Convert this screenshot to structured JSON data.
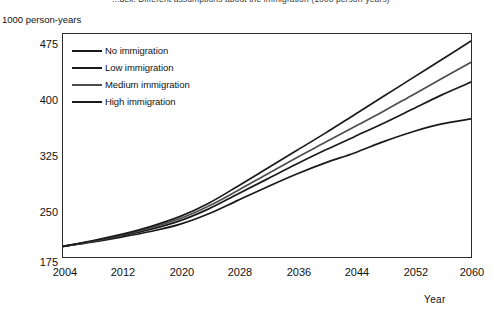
{
  "top_title": "...dex. Different assumptions about the immigration (1000 person-years)",
  "y_axis": {
    "unit_label": "1000 person-years",
    "ticks": [
      "475",
      "400",
      "325",
      "250",
      "175"
    ]
  },
  "x_axis": {
    "title": "Year",
    "ticks": [
      "2004",
      "2012",
      "2020",
      "2028",
      "2036",
      "2044",
      "2052",
      "2060"
    ]
  },
  "legend": {
    "items": [
      {
        "label": "No  immigration",
        "color": "#1a1a1a"
      },
      {
        "label": "Low  immigration",
        "color": "#1a1a1a"
      },
      {
        "label": "Medium immigration",
        "color": "#4d4d4d"
      },
      {
        "label": "High immigration",
        "color": "#1a1a1a"
      }
    ]
  },
  "chart_data": {
    "type": "line",
    "title": "Different assumptions about the immigration (1000 person-years)",
    "xlabel": "Year",
    "ylabel": "1000 person-years",
    "xlim": [
      2004,
      2060
    ],
    "ylim": [
      175,
      490
    ],
    "xticks": [
      2004,
      2012,
      2020,
      2028,
      2036,
      2044,
      2052,
      2060
    ],
    "yticks": [
      175,
      250,
      325,
      400,
      475
    ],
    "grid": false,
    "legend_position": "top-left-inside",
    "x": [
      2004,
      2008,
      2012,
      2016,
      2020,
      2024,
      2028,
      2032,
      2036,
      2040,
      2044,
      2048,
      2052,
      2056,
      2060
    ],
    "series": [
      {
        "name": "No immigration",
        "color": "#1a1a1a",
        "values": [
          190,
          196,
          203,
          211,
          221,
          236,
          255,
          274,
          292,
          308,
          322,
          338,
          352,
          363,
          370
        ]
      },
      {
        "name": "Low immigration",
        "color": "#1a1a1a",
        "values": [
          190,
          197,
          205,
          214,
          226,
          243,
          264,
          285,
          306,
          326,
          345,
          364,
          384,
          404,
          422
        ]
      },
      {
        "name": "Medium immigration",
        "color": "#4d4d4d",
        "values": [
          190,
          197,
          206,
          216,
          229,
          247,
          269,
          292,
          315,
          337,
          359,
          381,
          404,
          427,
          450
        ]
      },
      {
        "name": "High immigration",
        "color": "#1a1a1a",
        "values": [
          190,
          198,
          207,
          218,
          232,
          251,
          275,
          300,
          325,
          350,
          376,
          402,
          428,
          454,
          480
        ]
      }
    ]
  }
}
